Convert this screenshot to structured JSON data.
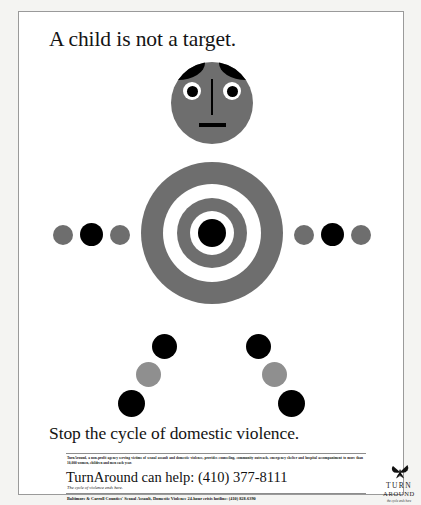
{
  "poster": {
    "headline": "A child is not a target.",
    "slogan": "Stop the cycle of domestic violence.",
    "colors": {
      "gray": "#6e6e6e",
      "black": "#000000",
      "white": "#ffffff",
      "frame": "#9a9a9a",
      "page": "#f4f4f2"
    }
  },
  "figure": {
    "head": {
      "label": "child-head",
      "fill": "#6e6e6e",
      "eyes": 2,
      "has_nose_line": true,
      "has_mouth_bar": true
    },
    "torso": {
      "label": "bullseye-target",
      "rings": [
        {
          "name": "outer-gray",
          "color": "#6e6e6e"
        },
        {
          "name": "gap-white",
          "color": "#ffffff"
        },
        {
          "name": "inner-gray",
          "color": "#6e6e6e"
        },
        {
          "name": "gap-white-inner",
          "color": "#ffffff"
        },
        {
          "name": "center-black",
          "color": "#000000"
        }
      ]
    },
    "left_arm_dots": [
      "#6e6e6e",
      "#000000",
      "#6e6e6e"
    ],
    "right_arm_dots": [
      "#6e6e6e",
      "#000000",
      "#6e6e6e"
    ],
    "left_leg_dots": [
      "#000000",
      "#8f8f8f",
      "#000000"
    ],
    "right_leg_dots": [
      "#000000",
      "#8f8f8f",
      "#000000"
    ]
  },
  "footer": {
    "blurb": "TurnAround, a non-profit agency serving victims of sexual assault and domestic violence, provides counseling, community outreach, emergency shelter and hospital accompaniment to more than 10,000 women, children and men each year.",
    "help_line": "TurnAround can help: (410) 377-8111",
    "tagline": "The cycle of violence ends here.",
    "hotline": "Baltimore & Carroll Counties' Sexual Assault, Domestic Violence 24-hour crisis hotline: (410) 828-6390"
  },
  "logo": {
    "icon": "butterfly-icon",
    "name": "TURN",
    "sub": "AROUND",
    "tagline": "the cycle ends here"
  }
}
